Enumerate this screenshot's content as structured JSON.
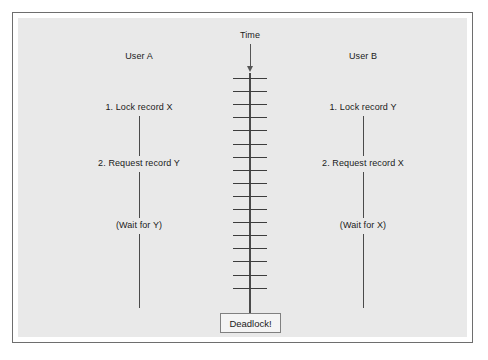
{
  "figure": {
    "type": "sequence-timeline-diagram",
    "title_visible": false,
    "background_color": "#e9e9e9",
    "border_color": "#6e6e6e"
  },
  "time_axis": {
    "label": "Time",
    "direction": "downward",
    "arrow_icon": "arrow-down-icon",
    "tick_count": 17
  },
  "columns": [
    {
      "id": "user-a",
      "header": "User A",
      "steps": [
        {
          "id": "step-1",
          "text": "1. Lock record X"
        },
        {
          "id": "step-2",
          "text": "2. Request record Y"
        },
        {
          "id": "step-3",
          "text": "(Wait for Y)"
        }
      ]
    },
    {
      "id": "user-b",
      "header": "User B",
      "steps": [
        {
          "id": "step-1",
          "text": "1. Lock record Y"
        },
        {
          "id": "step-2",
          "text": "2. Request record X"
        },
        {
          "id": "step-3",
          "text": "(Wait for X)"
        }
      ]
    }
  ],
  "outcome": {
    "label": "Deadlock!",
    "border_color": "#808080"
  },
  "chart_data": {
    "type": "table",
    "xlabel": "",
    "ylabel": "Time",
    "categories": [
      "User A",
      "User B"
    ],
    "rows": [
      {
        "time_step": 1,
        "user_a": "1. Lock record X",
        "user_b": "1. Lock record Y"
      },
      {
        "time_step": 2,
        "user_a": "2. Request record Y",
        "user_b": "2. Request record X"
      },
      {
        "time_step": 3,
        "user_a": "(Wait for Y)",
        "user_b": "(Wait for X)"
      },
      {
        "time_step": 4,
        "user_a": "Deadlock!",
        "user_b": "Deadlock!"
      }
    ]
  }
}
